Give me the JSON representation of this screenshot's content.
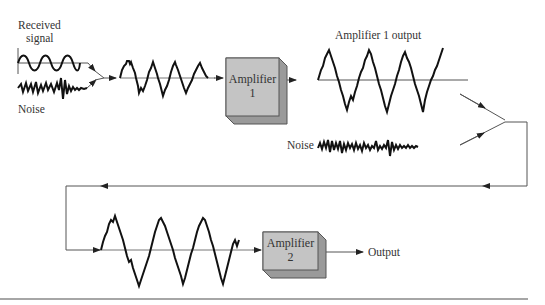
{
  "diagram": {
    "labels": {
      "received_signal_line1": "Received",
      "received_signal_line2": "signal",
      "noise_input": "Noise",
      "amplifier1_output": "Amplifier 1 output",
      "noise_second": "Noise",
      "output": "Output"
    },
    "blocks": [
      {
        "id": "amplifier1",
        "line1": "Amplifier",
        "line2": "1"
      },
      {
        "id": "amplifier2",
        "line1": "Amplifier",
        "line2": "2"
      }
    ],
    "colors": {
      "block_face": "#c4c4c4",
      "block_side": "#9a9a9a",
      "wave": "#111111",
      "line": "#555555"
    }
  }
}
